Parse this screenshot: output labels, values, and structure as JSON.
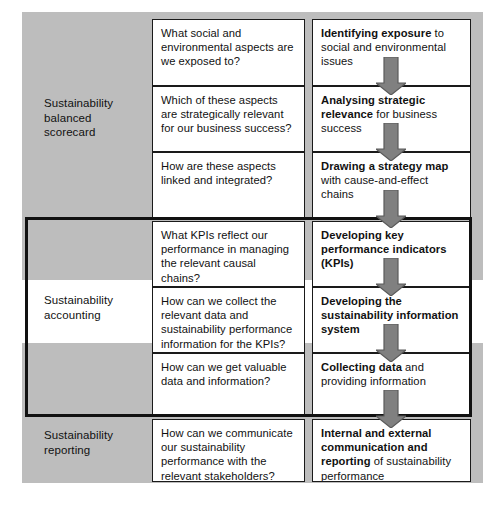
{
  "diagram": {
    "colors": {
      "plate": "#bdbdbd",
      "card_fill": "#ffffff",
      "card_border": "#1a1a1a",
      "arrow_fill": "#808080",
      "arrow_border": "#4d4d4d",
      "frame": "#111111",
      "text": "#111111"
    },
    "rows": [
      {
        "id": "sbsc",
        "label": "Sustainability\nbalanced\nscorecard",
        "label_line1": "Sustainability",
        "label_line2": "balanced",
        "label_line3": "scorecard"
      },
      {
        "id": "accounting",
        "label_line1": "Sustainability",
        "label_line2": "accounting",
        "highlighted": true
      },
      {
        "id": "reporting",
        "label_line1": "Sustainability",
        "label_line2": "reporting"
      }
    ],
    "steps": [
      {
        "index": 1,
        "row": "sbsc",
        "question": "What social and environmental aspects are we exposed to?",
        "answer_bold": "Identifying exposure",
        "answer_rest": " to social and environmental issues"
      },
      {
        "index": 2,
        "row": "sbsc",
        "question": "Which of these aspects are strategically relevant for our business success?",
        "answer_bold": "Analysing strategic relevance",
        "answer_rest": " for business success"
      },
      {
        "index": 3,
        "row": "sbsc",
        "question": "How are these aspects linked and integrated?",
        "answer_bold": "Drawing a strategy map",
        "answer_rest": " with cause-and-effect chains"
      },
      {
        "index": 4,
        "row": "accounting",
        "question": "What KPIs reflect our performance in managing the relevant causal chains?",
        "answer_bold": "Developing key performance indicators (KPIs)",
        "answer_rest": ""
      },
      {
        "index": 5,
        "row": "accounting",
        "question": "How can we collect the relevant data and sustainability performance information for the KPIs?",
        "answer_bold": "Developing the sustainability information system",
        "answer_rest": ""
      },
      {
        "index": 6,
        "row": "accounting",
        "question": "How can we get valuable data and information?",
        "answer_bold": "Collecting data",
        "answer_rest": " and providing information"
      },
      {
        "index": 7,
        "row": "reporting",
        "question": "How can we communicate our sustainability performance with the relevant stakeholders?",
        "answer_bold": "Internal and external communication and reporting",
        "answer_rest": " of sustainability performance"
      }
    ],
    "arrows": [
      {
        "id": "arrow-1-2",
        "from_step": 1,
        "to_step": 2,
        "direction": "down"
      },
      {
        "id": "arrow-2-3",
        "from_step": 2,
        "to_step": 3,
        "direction": "down"
      },
      {
        "id": "arrow-3-4",
        "from_step": 3,
        "to_step": 4,
        "direction": "down"
      },
      {
        "id": "arrow-4-5",
        "from_step": 4,
        "to_step": 5,
        "direction": "down"
      },
      {
        "id": "arrow-5-6",
        "from_step": 5,
        "to_step": 6,
        "direction": "down"
      },
      {
        "id": "arrow-6-7",
        "from_step": 6,
        "to_step": 7,
        "direction": "down"
      }
    ]
  }
}
